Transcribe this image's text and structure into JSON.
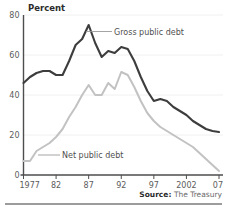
{
  "chart_data": {
    "type": "line",
    "title": "",
    "ylabel": "Percent",
    "xlabel": "",
    "ylim": [
      0,
      80
    ],
    "xlim": [
      1977,
      2007
    ],
    "yticks": [
      "0",
      "20",
      "40",
      "60",
      "80"
    ],
    "ytick_values": [
      0,
      20,
      40,
      60,
      80
    ],
    "xticks": [
      "1977",
      "82",
      "87",
      "92",
      "97",
      "2002",
      "07"
    ],
    "xtick_values": [
      1977,
      1982,
      1987,
      1992,
      1997,
      2002,
      2007
    ],
    "grid": "horizontal",
    "legend_position": "inline-annotations",
    "x": [
      1977,
      1978,
      1979,
      1980,
      1981,
      1982,
      1983,
      1984,
      1985,
      1986,
      1987,
      1988,
      1989,
      1990,
      1991,
      1992,
      1993,
      1994,
      1995,
      1996,
      1997,
      1998,
      1999,
      2000,
      2001,
      2002,
      2003,
      2004,
      2005,
      2006,
      2007
    ],
    "series": [
      {
        "name": "Gross public debt",
        "color": "#3d3d3d",
        "values": [
          46,
          49,
          51,
          52,
          52,
          50,
          50,
          57,
          65,
          68,
          75,
          66,
          59,
          62,
          61,
          64,
          63,
          57,
          49,
          42,
          37,
          38,
          37,
          34,
          32,
          30,
          27,
          25,
          23,
          22,
          21.5
        ]
      },
      {
        "name": "Net public debt",
        "color": "#c2c2c2",
        "values": [
          7,
          7,
          12,
          14,
          16,
          19,
          23,
          29,
          34,
          40,
          45,
          40,
          40,
          46,
          43,
          51.5,
          50,
          44,
          37,
          31,
          27,
          24,
          22,
          20,
          18,
          16,
          14,
          11,
          8,
          5,
          2
        ]
      }
    ],
    "annotations": [
      {
        "text": "Gross public debt",
        "series": "Gross public debt"
      },
      {
        "text": "Net public debt",
        "series": "Net public debt"
      }
    ]
  },
  "footer": {
    "source_label": "Source:",
    "source_value": "The Treasury"
  }
}
